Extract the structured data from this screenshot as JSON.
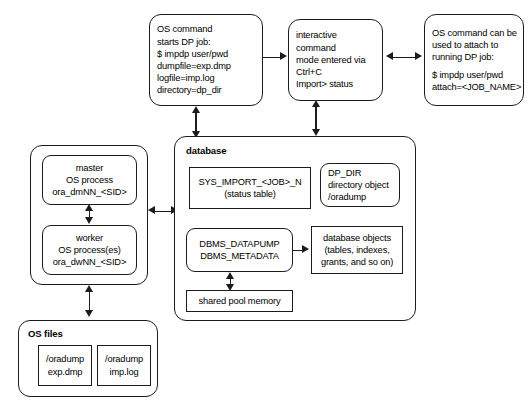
{
  "diagram": {
    "accent_color": "#1c1c1c",
    "background_color": "#ffffff"
  },
  "top_row": {
    "os_command_start": {
      "name": "os-command-start-box",
      "lines": [
        "OS command",
        "starts DP job:",
        "$ impdp user/pwd",
        "dumpfile=exp.dmp",
        "logfile=imp.log",
        "directory=dp_dir"
      ]
    },
    "interactive_mode": {
      "name": "interactive-command-mode-box",
      "lines": [
        "interactive",
        "command",
        "mode entered via",
        "Ctrl+C",
        "Import> status"
      ]
    },
    "os_command_attach": {
      "name": "os-command-attach-box",
      "lines": [
        "OS command can be",
        "used to attach to",
        "running DP job:",
        "",
        "$ impdp user/pwd",
        "attach=<JOB_NAME>"
      ]
    }
  },
  "processes": {
    "master": {
      "lines": [
        "master",
        "OS process",
        "ora_dmNN_<SID>"
      ]
    },
    "worker": {
      "lines": [
        "worker",
        "OS process(es)",
        "ora_dwNN_<SID>"
      ]
    }
  },
  "os_files": {
    "label": "OS files",
    "dump_file": {
      "lines": [
        "/oradump",
        "exp.dmp"
      ]
    },
    "log_file": {
      "lines": [
        "/oradump",
        "imp.log"
      ]
    }
  },
  "database": {
    "label": "database",
    "status_table": {
      "lines": [
        "SYS_IMPORT_<JOB>_N",
        "(status table)"
      ]
    },
    "dp_dir": {
      "lines": [
        "DP_DIR",
        "directory object",
        "/oradump"
      ]
    },
    "packages": {
      "lines": [
        "DBMS_DATAPUMP",
        "DBMS_METADATA"
      ]
    },
    "db_objects": {
      "lines": [
        "database objects",
        "(tables, indexes,",
        "grants, and so on)"
      ]
    },
    "shared_pool": {
      "lines": [
        "shared pool memory"
      ]
    }
  }
}
